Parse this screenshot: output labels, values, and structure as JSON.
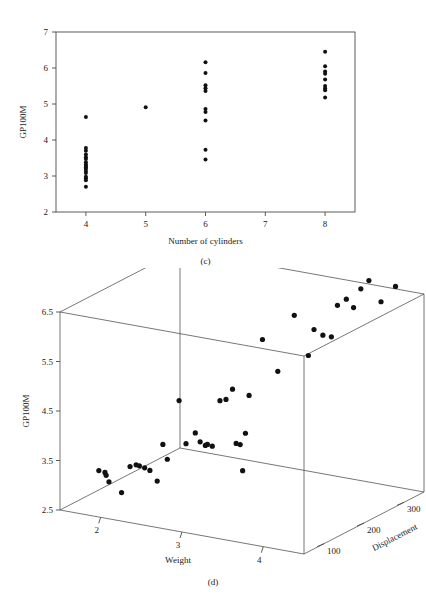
{
  "figure": {
    "panels": [
      {
        "id": "c",
        "caption": "(c)"
      },
      {
        "id": "d",
        "caption": "(d)"
      }
    ]
  },
  "panel_c": {
    "caption": "(c)",
    "ylabel": "GP100M",
    "xlabel": "Number of cylinders",
    "xticks": [
      "4",
      "5",
      "6",
      "7",
      "8"
    ],
    "yticks": [
      "2",
      "3",
      "4",
      "5",
      "6",
      "7"
    ]
  },
  "panel_d": {
    "caption": "(d)",
    "zlabel": "GP100M",
    "xlabel": "Weight",
    "ylabel": "Displacement",
    "zticks": [
      "2.5",
      "3.5",
      "4.5",
      "5.5",
      "6.5"
    ],
    "xticks": [
      "2",
      "3",
      "4"
    ],
    "yticks": [
      "100",
      "200",
      "300"
    ]
  },
  "chart_data": [
    {
      "type": "scatter",
      "id": "panel-c",
      "title": "",
      "caption": "(c)",
      "xlabel": "Number of cylinders",
      "ylabel": "GP100M",
      "xlim": [
        3.5,
        8.5
      ],
      "ylim": [
        2,
        7
      ],
      "xticks": [
        4,
        5,
        6,
        7,
        8
      ],
      "yticks": [
        2,
        3,
        4,
        5,
        6,
        7
      ],
      "grid": false,
      "legend": null,
      "marker": "filled-circle",
      "color": "#111111",
      "points": [
        {
          "x": 4,
          "y": 4.64
        },
        {
          "x": 4,
          "y": 3.78
        },
        {
          "x": 4,
          "y": 3.7
        },
        {
          "x": 4,
          "y": 3.6
        },
        {
          "x": 4,
          "y": 3.52
        },
        {
          "x": 4,
          "y": 3.47
        },
        {
          "x": 4,
          "y": 3.38
        },
        {
          "x": 4,
          "y": 3.32
        },
        {
          "x": 4,
          "y": 3.28
        },
        {
          "x": 4,
          "y": 3.24
        },
        {
          "x": 4,
          "y": 3.2
        },
        {
          "x": 4,
          "y": 3.14
        },
        {
          "x": 4,
          "y": 3.08
        },
        {
          "x": 4,
          "y": 2.98
        },
        {
          "x": 4,
          "y": 2.94
        },
        {
          "x": 4,
          "y": 2.88
        },
        {
          "x": 4,
          "y": 2.7
        },
        {
          "x": 5,
          "y": 4.91
        },
        {
          "x": 6,
          "y": 6.16
        },
        {
          "x": 6,
          "y": 5.86
        },
        {
          "x": 6,
          "y": 5.52
        },
        {
          "x": 6,
          "y": 5.44
        },
        {
          "x": 6,
          "y": 5.36
        },
        {
          "x": 6,
          "y": 4.86
        },
        {
          "x": 6,
          "y": 4.78
        },
        {
          "x": 6,
          "y": 4.54
        },
        {
          "x": 6,
          "y": 3.73
        },
        {
          "x": 6,
          "y": 3.46
        },
        {
          "x": 8,
          "y": 6.45
        },
        {
          "x": 8,
          "y": 6.05
        },
        {
          "x": 8,
          "y": 5.9
        },
        {
          "x": 8,
          "y": 5.84
        },
        {
          "x": 8,
          "y": 5.68
        },
        {
          "x": 8,
          "y": 5.5
        },
        {
          "x": 8,
          "y": 5.44
        },
        {
          "x": 8,
          "y": 5.38
        },
        {
          "x": 8,
          "y": 5.18
        }
      ]
    },
    {
      "type": "scatter3d",
      "id": "panel-d",
      "title": "",
      "caption": "(d)",
      "xlabel": "Weight",
      "ylabel": "Displacement",
      "zlabel": "GP100M",
      "xlim": [
        1.5,
        4.5
      ],
      "ylim": [
        50,
        350
      ],
      "zlim": [
        2.5,
        6.5
      ],
      "xticks": [
        2,
        3,
        4
      ],
      "yticks": [
        100,
        200,
        300
      ],
      "zticks": [
        2.5,
        3.5,
        4.5,
        5.5,
        6.5
      ],
      "grid": false,
      "legend": null,
      "marker": "filled-circle",
      "color": "#111111",
      "points": [
        {
          "x": 1.84,
          "y": 78,
          "z": 3.28
        },
        {
          "x": 1.91,
          "y": 79,
          "z": 3.26
        },
        {
          "x": 1.92,
          "y": 80,
          "z": 3.2
        },
        {
          "x": 1.93,
          "y": 85,
          "z": 3.05
        },
        {
          "x": 2.06,
          "y": 90,
          "z": 2.85
        },
        {
          "x": 2.14,
          "y": 95,
          "z": 3.38
        },
        {
          "x": 2.2,
          "y": 98,
          "z": 3.42
        },
        {
          "x": 2.23,
          "y": 100,
          "z": 3.4
        },
        {
          "x": 2.27,
          "y": 105,
          "z": 3.35
        },
        {
          "x": 2.32,
          "y": 108,
          "z": 3.3
        },
        {
          "x": 2.4,
          "y": 110,
          "z": 3.1
        },
        {
          "x": 2.46,
          "y": 112,
          "z": 3.85
        },
        {
          "x": 2.5,
          "y": 115,
          "z": 3.55
        },
        {
          "x": 2.62,
          "y": 120,
          "z": 4.75
        },
        {
          "x": 2.7,
          "y": 121,
          "z": 3.9
        },
        {
          "x": 2.77,
          "y": 130,
          "z": 4.1
        },
        {
          "x": 2.78,
          "y": 140,
          "z": 3.88
        },
        {
          "x": 2.82,
          "y": 145,
          "z": 3.8
        },
        {
          "x": 2.84,
          "y": 146,
          "z": 3.82
        },
        {
          "x": 2.88,
          "y": 150,
          "z": 3.78
        },
        {
          "x": 2.95,
          "y": 155,
          "z": 4.7
        },
        {
          "x": 3.0,
          "y": 160,
          "z": 4.72
        },
        {
          "x": 3.08,
          "y": 160,
          "z": 4.95
        },
        {
          "x": 3.11,
          "y": 163,
          "z": 3.85
        },
        {
          "x": 3.15,
          "y": 165,
          "z": 3.83
        },
        {
          "x": 3.17,
          "y": 167,
          "z": 3.3
        },
        {
          "x": 3.19,
          "y": 170,
          "z": 4.05
        },
        {
          "x": 3.21,
          "y": 175,
          "z": 4.8
        },
        {
          "x": 3.35,
          "y": 180,
          "z": 5.95
        },
        {
          "x": 3.44,
          "y": 200,
          "z": 5.25
        },
        {
          "x": 3.52,
          "y": 225,
          "z": 6.3
        },
        {
          "x": 3.57,
          "y": 250,
          "z": 5.4
        },
        {
          "x": 3.6,
          "y": 258,
          "z": 5.9
        },
        {
          "x": 3.65,
          "y": 270,
          "z": 5.75
        },
        {
          "x": 3.73,
          "y": 275,
          "z": 5.72
        },
        {
          "x": 3.78,
          "y": 280,
          "z": 6.35
        },
        {
          "x": 3.84,
          "y": 290,
          "z": 6.45
        },
        {
          "x": 3.88,
          "y": 300,
          "z": 6.25
        },
        {
          "x": 3.92,
          "y": 310,
          "z": 6.6
        },
        {
          "x": 3.98,
          "y": 318,
          "z": 6.75
        },
        {
          "x": 4.07,
          "y": 330,
          "z": 6.3
        },
        {
          "x": 4.15,
          "y": 350,
          "z": 6.55
        }
      ]
    }
  ]
}
